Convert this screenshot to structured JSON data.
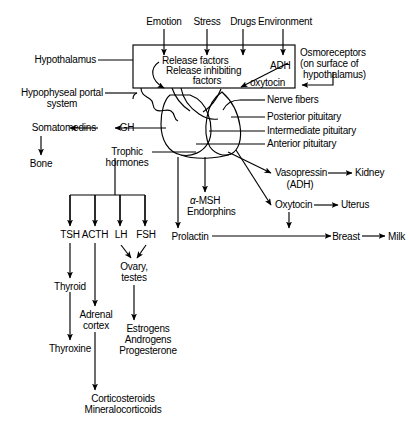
{
  "diagram": {
    "ink_color": "#000000",
    "background": "#ffffff"
  },
  "inputs": {
    "emotion": "Emotion",
    "stress": "Stress",
    "drugs": "Drugs",
    "environment": "Environment"
  },
  "hypothalamus": {
    "label": "Hypothalamus",
    "release_factors": "Release factors",
    "release_inhibiting_1": "Release inhibiting",
    "release_inhibiting_2": "factors",
    "adh": "ADH",
    "oxytocin": "oxytocin"
  },
  "osmoreceptors": {
    "line1": "Osmoreceptors",
    "line2": "(on surface of",
    "line3": "hypothalamus)"
  },
  "portal": {
    "line1": "Hypophyseal portal",
    "line2": "system"
  },
  "pituitary": {
    "nerve_fibers": "Nerve fibers",
    "posterior": "Posterior pituitary",
    "intermediate": "Intermediate pituitary",
    "anterior": "Anterior pituitary"
  },
  "gh_axis": {
    "somatomedins": "Somatomedins",
    "gh": "GH",
    "bone": "Bone"
  },
  "trophic": {
    "line1": "Trophic",
    "line2": "hormones",
    "tsh": "TSH",
    "acth": "ACTH",
    "lh": "LH",
    "fsh": "FSH"
  },
  "targets": {
    "thyroid": "Thyroid",
    "thyroxine": "Thyroxine",
    "adrenal_1": "Adrenal",
    "adrenal_2": "cortex",
    "corticosteroids_1": "Corticosteroids",
    "corticosteroids_2": "Mineralocorticoids",
    "ovary_1": "Ovary,",
    "ovary_2": "testes",
    "estrogens": "Estrogens",
    "androgens": "Androgens",
    "progesterone": "Progesterone"
  },
  "intermediate_lobe": {
    "alpha_msh_symbol": "α",
    "alpha_msh_rest": "-MSH",
    "endorphins": "Endorphins"
  },
  "prolactin_axis": {
    "prolactin": "Prolactin",
    "breast": "Breast",
    "milk": "Milk"
  },
  "posterior_axis": {
    "vasopressin": "Vasopressin",
    "adh_paren": "(ADH)",
    "kidney": "Kidney",
    "oxytocin": "Oxytocin",
    "uterus": "Uterus"
  }
}
